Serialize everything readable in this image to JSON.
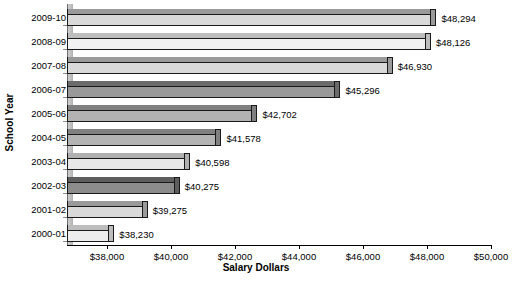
{
  "chart_data": {
    "type": "bar",
    "orientation": "horizontal",
    "title": "",
    "xlabel": "Salary Dollars",
    "ylabel": "School Year",
    "categories": [
      "2009-10",
      "2008-09",
      "2007-08",
      "2006-07",
      "2005-06",
      "2004-05",
      "2003-04",
      "2002-03",
      "2001-02",
      "2000-01"
    ],
    "values": [
      48294,
      48126,
      46930,
      45296,
      42702,
      41578,
      40598,
      40275,
      39275,
      38230
    ],
    "data_labels": [
      "$48,294",
      "$48,126",
      "$46,930",
      "$45,296",
      "$42,702",
      "$41,578",
      "$40,598",
      "$40,275",
      "$39,275",
      "$38,230"
    ],
    "xlim": [
      36750,
      50000
    ],
    "xticks": [
      38000,
      40000,
      42000,
      44000,
      46000,
      48000,
      50000
    ],
    "xticklabels": [
      "$38,000",
      "$40,000",
      "$42,000",
      "$44,000",
      "$46,000",
      "$48,000",
      "$50,000"
    ],
    "grid": false,
    "legend": false,
    "bar_colors": [
      "#d9d9d9",
      "#f2f2f2",
      "#d9d9d9",
      "#999999",
      "#b3b3b3",
      "#b3b3b3",
      "#e8e8e8",
      "#8c8c8c",
      "#d9d9d9",
      "#ededed"
    ],
    "bar_top_colors": [
      "#9a9a9a",
      "#bdbdbd",
      "#9a9a9a",
      "#6b6b6b",
      "#808080",
      "#808080",
      "#b0b0b0",
      "#5e5e5e",
      "#9a9a9a",
      "#bdbdbd"
    ]
  },
  "axes": {
    "x_title": "Salary Dollars",
    "y_title": "School Year"
  }
}
